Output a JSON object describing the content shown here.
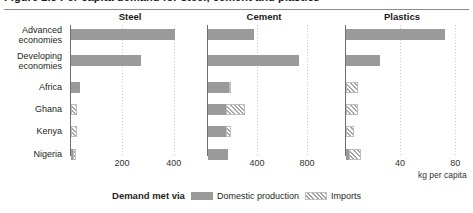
{
  "figure": {
    "title": "Figure 2.3 Per capita demand for steel, cement and plastics",
    "unit_label": "kg per capita",
    "legend": {
      "title": "Demand met via",
      "items": [
        {
          "label": "Domestic production",
          "swatch": "solid-gray-swatch",
          "color": "#9a9a9a"
        },
        {
          "label": "Imports",
          "swatch": "hatched-swatch",
          "color": "#a8a8a8"
        }
      ]
    }
  },
  "categories": [
    "Advanced\neconomies",
    "Developing\neconomies",
    "Africa",
    "Ghana",
    "Kenya",
    "Nigeria"
  ],
  "chart_data": {
    "type": "bar",
    "title": "Per capita demand for steel, cement and plastics",
    "orientation": "horizontal",
    "stacked": true,
    "xlabel": "kg per capita",
    "ylabel": "",
    "grid": true,
    "legend_position": "bottom",
    "categories": [
      "Advanced economies",
      "Developing economies",
      "Africa",
      "Ghana",
      "Kenya",
      "Nigeria"
    ],
    "series": [
      {
        "name": "Domestic production",
        "panel": "Steel",
        "values": [
          400,
          270,
          35,
          0,
          0,
          4
        ]
      },
      {
        "name": "Imports",
        "panel": "Steel",
        "values": [
          0,
          0,
          0,
          22,
          22,
          14
        ]
      },
      {
        "name": "Domestic production",
        "panel": "Cement",
        "values": [
          370,
          730,
          170,
          140,
          140,
          160
        ]
      },
      {
        "name": "Imports",
        "panel": "Cement",
        "values": [
          0,
          0,
          8,
          155,
          45,
          0
        ]
      },
      {
        "name": "Domestic production",
        "panel": "Plastics",
        "values": [
          72,
          25,
          0,
          0,
          0,
          2
        ]
      },
      {
        "name": "Imports",
        "panel": "Plastics",
        "values": [
          0,
          0,
          9,
          9,
          6,
          9
        ]
      }
    ],
    "panels": [
      {
        "name": "Steel",
        "xlim": [
          0,
          470
        ],
        "ticks": [
          200,
          400
        ],
        "rows": [
          {
            "category": "Advanced economies",
            "domestic": 400,
            "imports": 0
          },
          {
            "category": "Developing economies",
            "domestic": 270,
            "imports": 0
          },
          {
            "category": "Africa",
            "domestic": 35,
            "imports": 0
          },
          {
            "category": "Ghana",
            "domestic": 0,
            "imports": 22
          },
          {
            "category": "Kenya",
            "domestic": 0,
            "imports": 22
          },
          {
            "category": "Nigeria",
            "domestic": 4,
            "imports": 14
          }
        ]
      },
      {
        "name": "Cement",
        "xlim": [
          0,
          1000
        ],
        "ticks": [
          400,
          800
        ],
        "rows": [
          {
            "category": "Advanced economies",
            "domestic": 370,
            "imports": 0
          },
          {
            "category": "Developing economies",
            "domestic": 730,
            "imports": 0
          },
          {
            "category": "Africa",
            "domestic": 170,
            "imports": 8
          },
          {
            "category": "Ghana",
            "domestic": 140,
            "imports": 155
          },
          {
            "category": "Kenya",
            "domestic": 140,
            "imports": 45
          },
          {
            "category": "Nigeria",
            "domestic": 160,
            "imports": 0
          }
        ]
      },
      {
        "name": "Plastics",
        "xlim": [
          0,
          90
        ],
        "ticks": [
          40,
          80
        ],
        "rows": [
          {
            "category": "Advanced economies",
            "domestic": 72,
            "imports": 0
          },
          {
            "category": "Developing economies",
            "domestic": 25,
            "imports": 0
          },
          {
            "category": "Africa",
            "domestic": 0,
            "imports": 9
          },
          {
            "category": "Ghana",
            "domestic": 0,
            "imports": 9
          },
          {
            "category": "Kenya",
            "domestic": 0,
            "imports": 6
          },
          {
            "category": "Nigeria",
            "domestic": 2,
            "imports": 9
          }
        ]
      }
    ]
  }
}
